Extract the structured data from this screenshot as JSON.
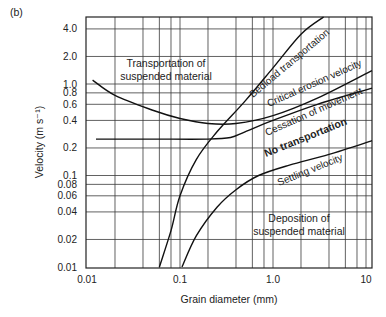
{
  "panel_label": "(b)",
  "chart_data": {
    "type": "line",
    "title": "",
    "panel": "(b)",
    "xlabel": "Grain diameter (mm)",
    "ylabel": "Velocity (m s⁻¹)",
    "xscale": "log",
    "yscale": "log",
    "xlim": [
      0.01,
      12
    ],
    "ylim": [
      0.01,
      5.4
    ],
    "grid": true,
    "legend": "none (curves labelled inline)",
    "x_ticks": [
      "0.01",
      "0.1",
      "1.0",
      "10"
    ],
    "y_ticks": [
      "0.01",
      "0.02",
      "0.04",
      "0.06",
      "0.08",
      "0.1",
      "0.2",
      "0.4",
      "0.6",
      "0.8",
      "1.0",
      "2.0",
      "4.0"
    ],
    "x_gridlines": [
      0.02,
      0.04,
      0.06,
      0.08,
      0.1,
      0.2,
      0.4,
      0.6,
      0.8,
      1.0,
      2.0,
      4.0,
      6.0,
      8.0,
      10
    ],
    "y_gridlines": [
      0.02,
      0.04,
      0.06,
      0.08,
      0.1,
      0.2,
      0.4,
      0.6,
      0.8,
      1.0,
      2.0,
      4.0
    ],
    "series": [
      {
        "name": "Critical erosion velocity",
        "x": [
          0.0115,
          0.02,
          0.05,
          0.1,
          0.2,
          0.4,
          1.0,
          3.0,
          12
        ],
        "y": [
          1.1,
          0.75,
          0.52,
          0.42,
          0.37,
          0.37,
          0.45,
          0.7,
          1.4
        ]
      },
      {
        "name": "Bedload transportation",
        "x": [
          0.06,
          0.08,
          0.1,
          0.15,
          0.25,
          0.5,
          1.0,
          2.0,
          3.5
        ],
        "y": [
          0.01,
          0.025,
          0.06,
          0.15,
          0.3,
          0.65,
          1.5,
          3.5,
          5.4
        ]
      },
      {
        "name": "Cessation of movement",
        "x": [
          0.0125,
          0.05,
          0.2,
          0.35,
          0.5,
          1.0,
          3.0,
          12
        ],
        "y": [
          0.25,
          0.25,
          0.25,
          0.26,
          0.3,
          0.4,
          0.6,
          0.9
        ]
      },
      {
        "name": "Settling velocity",
        "x": [
          0.105,
          0.15,
          0.25,
          0.4,
          0.7,
          1.5,
          4.0,
          12
        ],
        "y": [
          0.01,
          0.022,
          0.045,
          0.07,
          0.1,
          0.13,
          0.17,
          0.24
        ]
      }
    ],
    "annotations": [
      {
        "text": "Transportation of suspended material",
        "region": "upper-left"
      },
      {
        "text": "Bedload transportation",
        "along": "Bedload transportation curve"
      },
      {
        "text": "Critical erosion velocity",
        "along": "Critical erosion velocity curve"
      },
      {
        "text": "Cessation of movement",
        "along": "Cessation of movement curve"
      },
      {
        "text": "No transportation",
        "style": "bold",
        "region": "between cessation and settling"
      },
      {
        "text": "Settling velocity",
        "along": "Settling velocity curve"
      },
      {
        "text": "Deposition of suspended material",
        "region": "lower-right"
      }
    ]
  },
  "labels": {
    "x_axis": "Grain diameter (mm)",
    "y_axis": "Velocity (m s⁻¹)",
    "regions": {
      "suspended_line1": "Transportation of",
      "suspended_line2": "suspended material",
      "deposition_line1": "Deposition of",
      "deposition_line2": "suspended material",
      "no_transport": "No transportation"
    },
    "curves": {
      "bedload": "Bedload transportation",
      "critical": "Critical erosion velocity",
      "cessation": "Cessation of movement",
      "settling": "Settling velocity"
    }
  }
}
